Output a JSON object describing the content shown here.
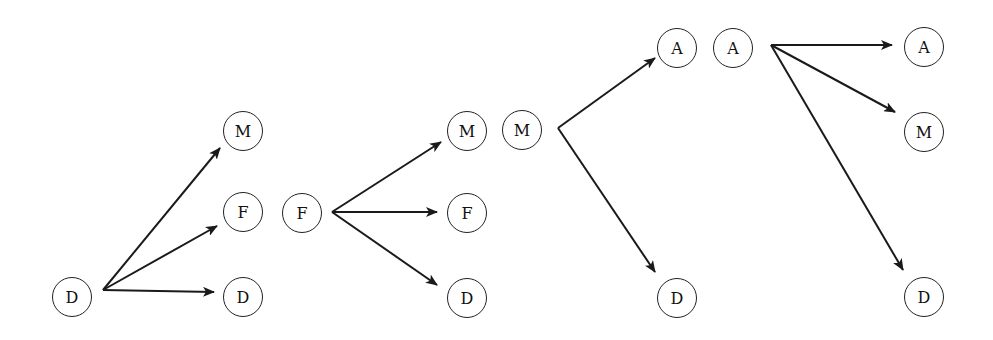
{
  "diagram": {
    "type": "transition-trees",
    "groups": [
      {
        "root": {
          "label": "D",
          "x": 72,
          "y": 297
        },
        "origin": {
          "x": 103,
          "y": 290
        },
        "children": [
          {
            "label": "M",
            "x": 243,
            "y": 131,
            "tip": {
              "x": 220,
              "y": 148
            }
          },
          {
            "label": "F",
            "x": 243,
            "y": 212,
            "tip": {
              "x": 217,
              "y": 226
            }
          },
          {
            "label": "D",
            "x": 243,
            "y": 297,
            "tip": {
              "x": 214,
              "y": 292
            }
          }
        ]
      },
      {
        "root": {
          "label": "F",
          "x": 302,
          "y": 213
        },
        "origin": {
          "x": 332,
          "y": 212
        },
        "children": [
          {
            "label": "M",
            "x": 467,
            "y": 131,
            "tip": {
              "x": 441,
              "y": 142
            }
          },
          {
            "label": "F",
            "x": 467,
            "y": 213,
            "tip": {
              "x": 437,
              "y": 212
            }
          },
          {
            "label": "D",
            "x": 467,
            "y": 298,
            "tip": {
              "x": 437,
              "y": 285
            }
          }
        ]
      },
      {
        "root": {
          "label": "M",
          "x": 522,
          "y": 130
        },
        "origin": {
          "x": 558,
          "y": 128
        },
        "children": [
          {
            "label": "A",
            "x": 677,
            "y": 48,
            "tip": {
              "x": 655,
              "y": 58
            }
          },
          {
            "label": "D",
            "x": 677,
            "y": 298,
            "tip": {
              "x": 655,
              "y": 272
            }
          }
        ]
      },
      {
        "root": {
          "label": "A",
          "x": 733,
          "y": 48
        },
        "origin": {
          "x": 771,
          "y": 45
        },
        "children": [
          {
            "label": "A",
            "x": 924,
            "y": 47,
            "tip": {
              "x": 892,
              "y": 45
            }
          },
          {
            "label": "M",
            "x": 924,
            "y": 132,
            "tip": {
              "x": 895,
              "y": 112
            }
          },
          {
            "label": "D",
            "x": 924,
            "y": 297,
            "tip": {
              "x": 903,
              "y": 270
            }
          }
        ]
      }
    ]
  }
}
